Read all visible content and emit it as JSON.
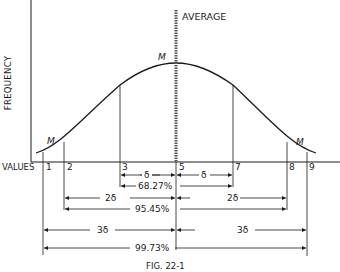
{
  "diagram": {
    "y_axis_label": "FREQUENCY",
    "x_axis_label": "VALUES",
    "average_label": "AVERAGE",
    "curve_markers": [
      "M",
      "M",
      "M"
    ],
    "x_ticks": [
      "1",
      "2",
      "3",
      "5",
      "7",
      "8",
      "9"
    ],
    "ranges": [
      {
        "span_label_left": "δ",
        "span_label_right": "δ",
        "percent": "68.27%"
      },
      {
        "span_label_left": "2δ",
        "span_label_right": "2δ",
        "percent": "95.45%"
      },
      {
        "span_label_left": "3δ",
        "span_label_right": "3δ",
        "percent": "99.73%"
      }
    ],
    "caption": "FIG. 22-1"
  }
}
